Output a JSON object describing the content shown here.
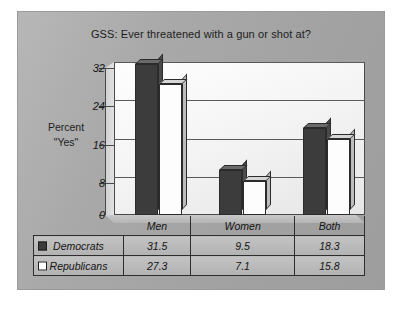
{
  "chart_data": {
    "type": "bar",
    "title": "GSS: Ever threatened with a gun or shot at?",
    "xlabel": "",
    "ylabel": "Percent \"Yes\"",
    "ylabel_line1": "Percent",
    "ylabel_line2": "\"Yes\"",
    "categories": [
      "Men",
      "Women",
      "Both"
    ],
    "series": [
      {
        "name": "Democrats",
        "values": [
          31.5,
          9.5,
          18.3
        ],
        "color": "#3c3c3c"
      },
      {
        "name": "Republicans",
        "values": [
          27.3,
          7.1,
          15.8
        ],
        "color": "#ffffff"
      }
    ],
    "yticks": [
      0,
      8,
      16,
      24,
      32
    ],
    "ylim": [
      0,
      32
    ],
    "grid": true,
    "legend_position": "data-table",
    "style": "3d-clustered-column-with-data-table"
  },
  "table": {
    "header_blank": "",
    "rows": [
      {
        "label": "Democrats",
        "swatch": "filled-square-icon",
        "cells": [
          "31.5",
          "9.5",
          "18.3"
        ]
      },
      {
        "label": "Republicans",
        "swatch": "open-square-icon",
        "cells": [
          "27.3",
          "7.1",
          "15.8"
        ]
      }
    ]
  }
}
